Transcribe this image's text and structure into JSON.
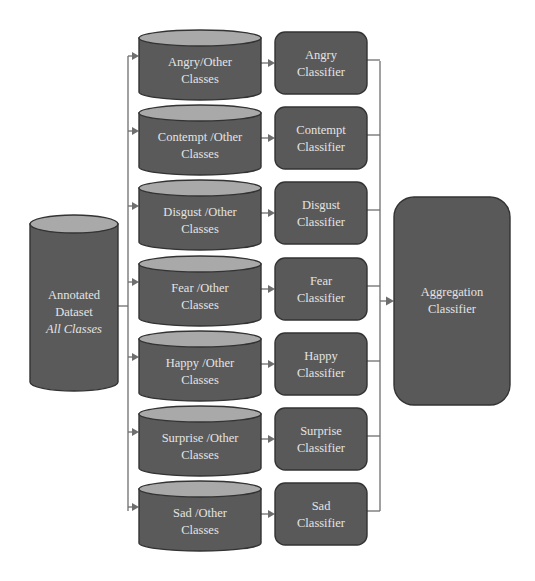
{
  "source": {
    "line1": "Annotated",
    "line2": "Dataset",
    "line3": "All Classes"
  },
  "datasets": [
    {
      "line1": "Angry/Other",
      "line2": "Classes"
    },
    {
      "line1": "Contempt /Other",
      "line2": "Classes"
    },
    {
      "line1": "Disgust /Other",
      "line2": "Classes"
    },
    {
      "line1": "Fear /Other",
      "line2": "Classes"
    },
    {
      "line1": "Happy /Other",
      "line2": "Classes"
    },
    {
      "line1": "Surprise /Other",
      "line2": "Classes"
    },
    {
      "line1": "Sad /Other",
      "line2": "Classes"
    }
  ],
  "classifiers": [
    {
      "line1": "Angry",
      "line2": "Classifier"
    },
    {
      "line1": "Contempt",
      "line2": "Classifier"
    },
    {
      "line1": "Disgust",
      "line2": "Classifier"
    },
    {
      "line1": "Fear",
      "line2": "Classifier"
    },
    {
      "line1": "Happy",
      "line2": "Classifier"
    },
    {
      "line1": "Surprise",
      "line2": "Classifier"
    },
    {
      "line1": "Sad",
      "line2": "Classifier"
    }
  ],
  "aggregator": {
    "line1": "Aggregation",
    "line2": "Classifier"
  },
  "colors": {
    "node_fill": "#5a5a5a",
    "cylinder_top": "#a9a9a9",
    "text": "#e4e4e4",
    "connector": "#6e6e6e"
  }
}
